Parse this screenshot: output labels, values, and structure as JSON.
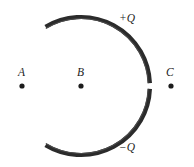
{
  "figure": {
    "background_color": "#ffffff",
    "width": 194,
    "height": 167
  },
  "arc": {
    "name": "charged-arc",
    "shape": "open circular arc (C-shape opening to the left)",
    "center_x": 81,
    "center_y": 85,
    "radius": 69,
    "stroke_color": "#2b2b2b",
    "stroke_width": 4.2,
    "upper_segment": {
      "label": "+Q",
      "start_angle_deg": -59,
      "end_angle_deg": -1.5
    },
    "lower_segment": {
      "label": "−Q",
      "start_angle_deg": 1.5,
      "end_angle_deg": 59
    },
    "gap": {
      "name": "arc-gap",
      "description": "small break at the rightmost point of the arc",
      "center_y": 86
    }
  },
  "charge_labels": {
    "positive": "+Q",
    "negative": "−Q"
  },
  "points": [
    {
      "label": "A",
      "x": 22,
      "y": 86,
      "dot_radius": 2.6
    },
    {
      "label": "B",
      "x": 81,
      "y": 86,
      "dot_radius": 2.6
    },
    {
      "label": "C",
      "x": 171,
      "y": 86,
      "dot_radius": 2.6
    }
  ],
  "colors": {
    "ink": "#1c1c1c",
    "arc": "#2b2b2b",
    "arc_highlight": "#4a4a4a",
    "background": "#ffffff"
  }
}
